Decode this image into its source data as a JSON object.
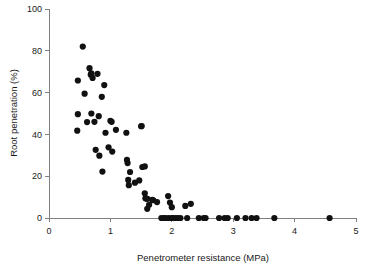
{
  "chart_data": {
    "type": "scatter",
    "title": "",
    "xlabel": "Penetrometer resistance (MPa)",
    "ylabel": "Root penetration (%)",
    "xlim": [
      0,
      5
    ],
    "ylim": [
      0,
      100
    ],
    "xticks": [
      0,
      1,
      2,
      3,
      4,
      5
    ],
    "yticks": [
      0,
      20,
      40,
      60,
      80,
      100
    ],
    "xtick_labels": [
      "0",
      "1",
      "2",
      "3",
      "4",
      "5"
    ],
    "ytick_labels": [
      "0",
      "20",
      "40",
      "60",
      "80",
      "100"
    ],
    "grid": false,
    "legend": false,
    "marker": {
      "shape": "circle",
      "color": "#111111",
      "size": 3.1
    },
    "series": [
      {
        "name": "Root penetration vs penetrometer resistance",
        "points": [
          [
            0.47,
            65.8
          ],
          [
            0.47,
            49.7
          ],
          [
            0.46,
            41.8
          ],
          [
            0.55,
            82.0
          ],
          [
            0.58,
            59.5
          ],
          [
            0.62,
            45.9
          ],
          [
            0.66,
            71.7
          ],
          [
            0.68,
            68.6
          ],
          [
            0.69,
            69.2
          ],
          [
            0.69,
            50.0
          ],
          [
            0.71,
            67.0
          ],
          [
            0.74,
            46.0
          ],
          [
            0.76,
            32.6
          ],
          [
            0.79,
            69.0
          ],
          [
            0.81,
            48.7
          ],
          [
            0.82,
            29.8
          ],
          [
            0.86,
            58.0
          ],
          [
            0.87,
            22.2
          ],
          [
            0.9,
            63.6
          ],
          [
            0.92,
            40.8
          ],
          [
            0.97,
            33.8
          ],
          [
            1.0,
            46.5
          ],
          [
            1.02,
            46.0
          ],
          [
            1.03,
            31.8
          ],
          [
            1.09,
            42.2
          ],
          [
            1.26,
            40.8
          ],
          [
            1.27,
            27.8
          ],
          [
            1.28,
            26.3
          ],
          [
            1.29,
            18.2
          ],
          [
            1.3,
            15.7
          ],
          [
            1.32,
            22.0
          ],
          [
            1.4,
            16.9
          ],
          [
            1.47,
            18.0
          ],
          [
            1.5,
            43.9
          ],
          [
            1.51,
            44.0
          ],
          [
            1.52,
            24.4
          ],
          [
            1.56,
            24.7
          ],
          [
            1.56,
            11.8
          ],
          [
            1.57,
            9.4
          ],
          [
            1.59,
            9.3
          ],
          [
            1.6,
            9.2
          ],
          [
            1.6,
            4.4
          ],
          [
            1.63,
            6.3
          ],
          [
            1.68,
            8.7
          ],
          [
            1.7,
            8.5
          ],
          [
            1.76,
            7.6
          ],
          [
            1.83,
            0.0
          ],
          [
            1.87,
            0.0
          ],
          [
            1.9,
            0.0
          ],
          [
            1.94,
            10.5
          ],
          [
            1.95,
            0.0
          ],
          [
            1.97,
            7.4
          ],
          [
            2.0,
            0.0
          ],
          [
            2.0,
            5.2
          ],
          [
            2.02,
            0.0
          ],
          [
            2.06,
            0.0
          ],
          [
            2.1,
            0.0
          ],
          [
            2.14,
            0.0
          ],
          [
            2.22,
            5.8
          ],
          [
            2.25,
            0.0
          ],
          [
            2.31,
            6.8
          ],
          [
            2.44,
            0.0
          ],
          [
            2.52,
            0.0
          ],
          [
            2.55,
            0.0
          ],
          [
            2.77,
            0.0
          ],
          [
            2.86,
            0.0
          ],
          [
            2.91,
            0.0
          ],
          [
            3.06,
            0.0
          ],
          [
            3.2,
            0.0
          ],
          [
            3.3,
            0.0
          ],
          [
            3.38,
            0.0
          ],
          [
            3.67,
            0.0
          ],
          [
            4.57,
            0.0
          ]
        ]
      }
    ]
  }
}
